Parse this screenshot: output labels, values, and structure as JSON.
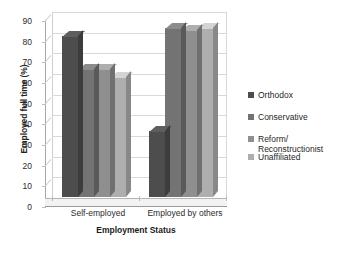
{
  "chart_data": {
    "type": "bar",
    "title": "",
    "xlabel": "Employment Status",
    "ylabel": "Employed full time (%)",
    "categories": [
      "Self-employed",
      "Employed by others"
    ],
    "series": [
      {
        "name": "Orthodox",
        "values": [
          78,
          32
        ],
        "color": "#4d4d4d"
      },
      {
        "name": "Conservative",
        "values": [
          62,
          82
        ],
        "color": "#737373"
      },
      {
        "name": "Reform/\nReconstructionist",
        "values": [
          62,
          81
        ],
        "color": "#8f8f8f"
      },
      {
        "name": "Unaffiliated",
        "values": [
          58,
          82
        ],
        "color": "#aeaeae"
      }
    ],
    "ylim": [
      0,
      90
    ],
    "yticks": [
      "0",
      "10",
      "20",
      "30",
      "40",
      "50",
      "60",
      "70",
      "80",
      "90"
    ],
    "grid": true,
    "legend_position": "right",
    "style": "3d-clustered-column"
  },
  "legend": {
    "items": [
      {
        "label": "Orthodox"
      },
      {
        "label": "Conservative"
      },
      {
        "label": "Reform/\nReconstructionist"
      },
      {
        "label": "Unaffiliated"
      }
    ]
  },
  "axes": {
    "y_title": "Employed full time (%)",
    "x_title": "Employment Status",
    "x_tick_0": "Self-employed",
    "x_tick_1": "Employed by others",
    "y_tick_0": "0",
    "y_tick_1": "10",
    "y_tick_2": "20",
    "y_tick_3": "30",
    "y_tick_4": "40",
    "y_tick_5": "50",
    "y_tick_6": "60",
    "y_tick_7": "70",
    "y_tick_8": "80",
    "y_tick_9": "90"
  }
}
